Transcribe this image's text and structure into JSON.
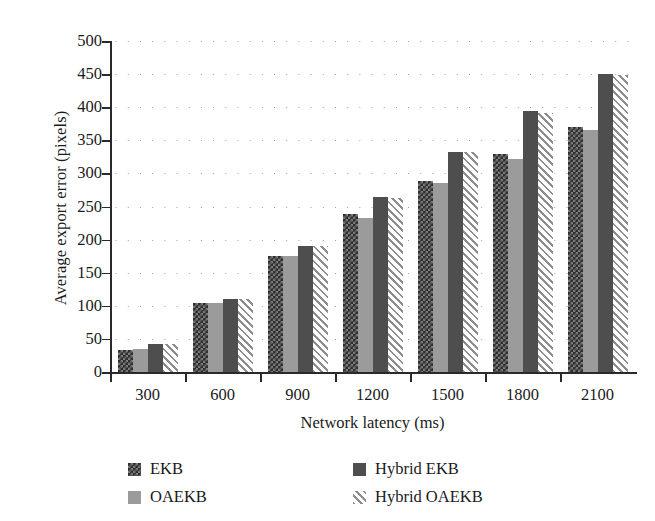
{
  "chart_data": {
    "type": "bar",
    "title": "",
    "xlabel": "Network latency (ms)",
    "ylabel": "Average export error (pixels)",
    "categories": [
      "300",
      "600",
      "900",
      "1200",
      "1500",
      "1800",
      "2100"
    ],
    "series": [
      {
        "name": "EKB",
        "values": [
          33,
          105,
          176,
          238,
          289,
          330,
          370
        ]
      },
      {
        "name": "OAEKB",
        "values": [
          35,
          104,
          175,
          232,
          286,
          322,
          365
        ]
      },
      {
        "name": "Hybrid EKB",
        "values": [
          43,
          111,
          191,
          265,
          333,
          394,
          450
        ]
      },
      {
        "name": "Hybrid OAEKB",
        "values": [
          42,
          110,
          191,
          263,
          332,
          392,
          449
        ]
      }
    ],
    "ylim": [
      0,
      500
    ],
    "yticks": [
      0,
      50,
      100,
      150,
      200,
      250,
      300,
      350,
      400,
      450,
      500
    ],
    "ytick_labels": [
      "0",
      "50",
      "100",
      "150",
      "200",
      "250",
      "300",
      "350",
      "400",
      "450",
      "500"
    ],
    "grid": "horizontal-dotted",
    "legend_position": "below-chart",
    "legend": [
      {
        "label": "EKB",
        "pattern": "checkerboard",
        "color": "#2e2e2e"
      },
      {
        "label": "OAEKB",
        "pattern": "solid",
        "color": "#9b9b9b"
      },
      {
        "label": "Hybrid EKB",
        "pattern": "solid",
        "color": "#4e4e4e"
      },
      {
        "label": "Hybrid OAEKB",
        "pattern": "diagonal-hatch",
        "color": "#8d8d8d"
      }
    ]
  }
}
